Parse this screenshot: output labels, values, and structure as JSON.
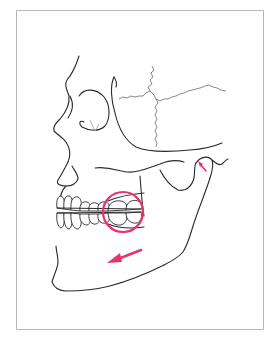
{
  "figure": {
    "frame_border_color": "#b8b8b8",
    "line_color": "#2a2a2a",
    "annotation_color": "#e8336a"
  },
  "annotations": {
    "molar_circle": {
      "label": "occlusal contact region (molars)",
      "color": "#e8336a"
    },
    "direction_arrow": {
      "label": "forward/downward mandible movement",
      "color": "#e8336a"
    },
    "condyle_mark": {
      "label": "condyle / TMJ indicator",
      "color": "#e8336a"
    }
  }
}
